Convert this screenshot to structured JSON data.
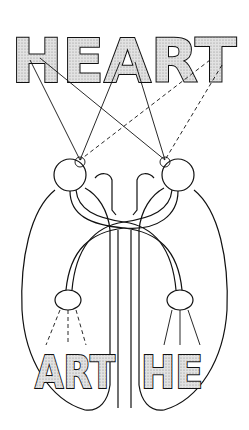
{
  "diagram": {
    "title_word": "HEART",
    "top_label": "HEART",
    "bottom_left_label": "ART",
    "bottom_right_label": "HE",
    "colors": {
      "ink": "#111111",
      "letter_fill": "#d4d4d4",
      "background": "#ffffff"
    }
  }
}
